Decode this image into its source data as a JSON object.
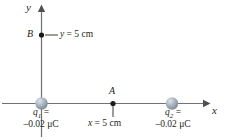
{
  "figure": {
    "axes": {
      "x_label": "x",
      "y_label": "y",
      "color": "#6e7275"
    },
    "points": [
      {
        "name": "B",
        "label": "B",
        "annotation_prefix": "y",
        "annotation_eq": " = 5 cm"
      },
      {
        "name": "A",
        "label": "A",
        "annotation_prefix": "x",
        "annotation_eq": " = 5 cm"
      }
    ],
    "charges": [
      {
        "name": "q1",
        "symbol": "q",
        "subscript": "1",
        "equals": " =",
        "value": "–0.02 μC",
        "color": "#8c9aa6"
      },
      {
        "name": "q2",
        "symbol": "q",
        "subscript": "2",
        "equals": " =",
        "value": "–0.02 μC",
        "color": "#8c9aa6"
      }
    ]
  }
}
